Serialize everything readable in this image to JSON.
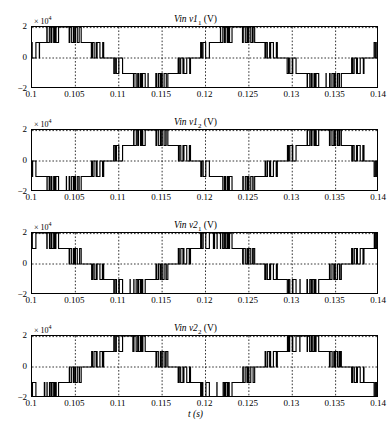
{
  "figure": {
    "xlabel": "t (s)",
    "caption": "",
    "multiplier": "× 10",
    "multiplier_exp": "4",
    "n_subplots": 4,
    "colors": {
      "trace": "#000000",
      "grid": "#000000",
      "frame": "#000000",
      "background": "#ffffff"
    }
  },
  "chart_data": {
    "type": "line",
    "xlabel": "t (s)",
    "ylabel": "",
    "xlim": [
      0.1,
      0.14
    ],
    "ylim": [
      -20000,
      20000
    ],
    "y_multiplier": 10000,
    "grid": true,
    "legend_position": "none",
    "xticks": [
      0.1,
      0.105,
      0.11,
      0.115,
      0.12,
      0.125,
      0.13,
      0.135,
      0.14
    ],
    "xtick_labels": [
      "0.1",
      "0.105",
      "0.11",
      "0.115",
      "0.12",
      "0.125",
      "0.13",
      "0.135",
      "0.14"
    ],
    "yticks": [
      -20000,
      0,
      20000
    ],
    "ytick_labels": [
      "−2",
      "0",
      "2"
    ],
    "fundamental_period_s": 0.02,
    "fundamental_freq_hz": 50,
    "switching_note": "Staircase multilevel PWM, 5 levels (-2e4, -1e4, 0, 1e4, 2e4) with high-frequency chopping at level transitions",
    "series": [
      {
        "name": "Vin v1_1",
        "title": "Vin v1₁ (V)",
        "phase_deg": 0,
        "levels": [
          -20000,
          -10000,
          0,
          10000,
          20000
        ],
        "plateau_levels": [
          10000,
          20000,
          10000,
          0,
          -10000,
          -20000,
          -10000,
          0
        ],
        "ylim": [
          -20000,
          20000
        ]
      },
      {
        "name": "Vin v1_2",
        "title": "Vin v1₂ (V)",
        "phase_deg": 180,
        "levels": [
          -20000,
          -10000,
          0,
          10000,
          20000
        ],
        "plateau_levels": [
          -10000,
          -20000,
          -10000,
          0,
          10000,
          20000,
          10000,
          0
        ],
        "ylim": [
          -20000,
          20000
        ]
      },
      {
        "name": "Vin v2_1",
        "title": "Vin v2₁ (V)",
        "phase_deg": 0,
        "levels": [
          -20000,
          -10000,
          0,
          10000,
          20000
        ],
        "plateau_levels": [
          20000,
          10000,
          0,
          -10000,
          -20000,
          -10000,
          0,
          10000
        ],
        "ylim": [
          -20000,
          20000
        ]
      },
      {
        "name": "Vin v2_2",
        "title": "Vin v2₂ (V)",
        "phase_deg": 180,
        "levels": [
          -20000,
          -10000,
          0,
          10000,
          20000
        ],
        "plateau_levels": [
          -20000,
          -10000,
          0,
          10000,
          20000,
          10000,
          0,
          -10000
        ],
        "ylim": [
          -20000,
          20000
        ]
      }
    ]
  },
  "subplots": [
    {
      "title_main": "Vin v1",
      "title_sub": "1",
      "title_unit": " (V)"
    },
    {
      "title_main": "Vin v1",
      "title_sub": "2",
      "title_unit": " (V)"
    },
    {
      "title_main": "Vin v2",
      "title_sub": "1",
      "title_unit": " (V)"
    },
    {
      "title_main": "Vin v2",
      "title_sub": "2",
      "title_unit": " (V)"
    }
  ]
}
